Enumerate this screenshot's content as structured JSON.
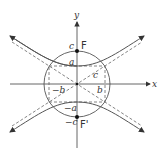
{
  "diagram": {
    "axes": {
      "x_label": "x",
      "y_label": "y"
    },
    "labels": {
      "focus_upper": "F",
      "focus_lower": "F'",
      "c_upper": "c",
      "c_lower": "−c",
      "a_upper": "a",
      "a_lower": "−a",
      "b_right": "b",
      "b_left": "−b",
      "c_diag": "c"
    },
    "colors": {
      "stroke": "#555555",
      "dash": "#666666",
      "point": "#111111"
    }
  }
}
